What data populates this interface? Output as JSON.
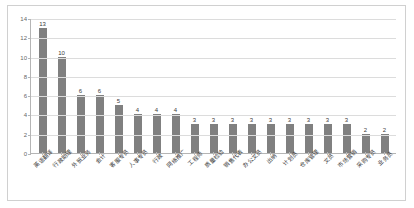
{
  "chart_data": {
    "type": "bar",
    "title": "",
    "xlabel": "",
    "ylabel": "",
    "ylim": [
      0,
      14
    ],
    "yticks": [
      0,
      2,
      4,
      6,
      8,
      10,
      12,
      14
    ],
    "grid": true,
    "legend": "none",
    "bar_color": "#808080",
    "categories": [
      "英语翻译",
      "行政助理",
      "外贸业务",
      "会计",
      "客服专员",
      "人事专员",
      "行政",
      "网络推广",
      "工程师",
      "质量检验",
      "销售代表",
      "办公文员",
      "出纳",
      "计划员",
      "仓库管理",
      "文员",
      "市场营销",
      "采购专员",
      "业务员"
    ],
    "values": [
      13,
      10,
      6,
      6,
      5,
      4,
      4,
      4,
      3,
      3,
      3,
      3,
      3,
      3,
      3,
      3,
      3,
      2,
      2
    ],
    "value_labels": [
      "13",
      "10",
      "6",
      "6",
      "5",
      "4",
      "4",
      "4",
      "3",
      "3",
      "3",
      "3",
      "3",
      "3",
      "3",
      "3",
      "3",
      "2",
      "2"
    ]
  }
}
